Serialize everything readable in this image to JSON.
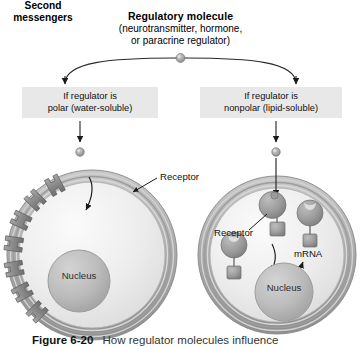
{
  "figure": {
    "title_main": "Regulatory molecule",
    "title_sub_line1": "(neurotransmitter, hormone,",
    "title_sub_line2": "or paracrine regulator)",
    "caption_number": "Figure 6-20",
    "caption_text": "How regulator molecules influence"
  },
  "branches": {
    "left": {
      "line1": "If regulator is",
      "line2": "polar (water-soluble)"
    },
    "right": {
      "line1": "If regulator is",
      "line2": "nonpolar (lipid-soluble)"
    }
  },
  "left_cell": {
    "receptor_label": "Receptor",
    "second_messengers_line1": "Second",
    "second_messengers_line2": "messengers",
    "nucleus_label": "Nucleus"
  },
  "right_cell": {
    "receptor_label": "Receptor",
    "mrna_label": "mRNA",
    "nucleus_label": "Nucleus"
  },
  "icons": {
    "regulatory_molecule": "ligand-sphere-icon",
    "membrane_receptor": "transmembrane-receptor-icon",
    "intracellular_receptor": "intracellular-receptor-icon",
    "arrow": "arrow-icon"
  },
  "colors": {
    "box_background": "#e8e8e8",
    "membrane": "#9a9a9a",
    "cytoplasm": "#ececec",
    "nucleus": "#b9b9b9",
    "receptor": "#8d8d8d",
    "line": "#1a1a1a"
  }
}
